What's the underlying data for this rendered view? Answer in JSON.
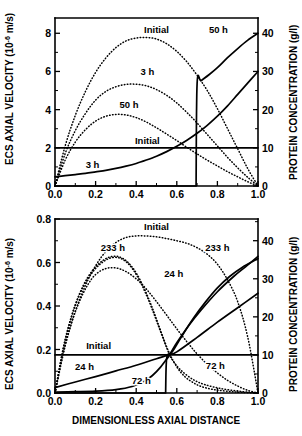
{
  "figure": {
    "xlabel": "DIMENSIONLESS AXIAL DISTANCE",
    "ylabel_left_main": "ECS AXIAL VELOCITY (10",
    "ylabel_left_exp": "-6",
    "ylabel_left_tail": " m/s)",
    "ylabel_right": "PROTEIN CONCENTRATION (g/l)"
  },
  "chart_data": [
    {
      "type": "line",
      "panel": "top",
      "title": "",
      "xlabel": "DIMENSIONLESS AXIAL DISTANCE",
      "ylabel": "ECS AXIAL VELOCITY (10^-6 m/s)",
      "ylabel_right": "PROTEIN CONCENTRATION (g/l)",
      "xlim": [
        0.0,
        1.0
      ],
      "ylim": [
        0,
        8.8
      ],
      "ylim_right": [
        0,
        44
      ],
      "grid": false,
      "legend": "inline-annotations",
      "xticks": [
        "0.0",
        "0.2",
        "0.4",
        "0.6",
        "0.8",
        "1.0"
      ],
      "xtick_values": [
        0.0,
        0.2,
        0.4,
        0.6,
        0.8,
        1.0
      ],
      "yticks_left": [
        "0",
        "2",
        "4",
        "6",
        "8"
      ],
      "ytick_left_values": [
        0,
        2,
        4,
        6,
        8
      ],
      "yticks_right": [
        "0",
        "10",
        "20",
        "30",
        "40"
      ],
      "ytick_right_values": [
        0,
        10,
        20,
        30,
        40
      ],
      "annotations": [
        {
          "text": "Initial",
          "x": 0.5,
          "y": 8.15,
          "series": "velocity-initial"
        },
        {
          "text": "3 h",
          "x": 0.455,
          "y": 5.95,
          "series": "velocity-3h"
        },
        {
          "text": "50 h",
          "x": 0.365,
          "y": 4.25,
          "series": "velocity-50h"
        },
        {
          "text": "Initial",
          "x": 0.455,
          "y": 2.38,
          "series": "concentration-initial"
        },
        {
          "text": "3 h",
          "x": 0.185,
          "y": 1.1,
          "series": "concentration-3h"
        },
        {
          "text": "50 h",
          "x": 0.805,
          "y": 8.15,
          "series": "concentration-50h"
        }
      ],
      "series": [
        {
          "name": "Initial",
          "axis": "left",
          "style": "dotted",
          "label": "Initial",
          "x": [
            0.0,
            0.05,
            0.1,
            0.15,
            0.2,
            0.25,
            0.3,
            0.35,
            0.4,
            0.45,
            0.5,
            0.55,
            0.6,
            0.65,
            0.7,
            0.75,
            0.8,
            0.85,
            0.9,
            0.95,
            1.0
          ],
          "values": [
            0.0,
            2.1,
            3.7,
            4.95,
            5.95,
            6.7,
            7.25,
            7.6,
            7.75,
            7.78,
            7.7,
            7.45,
            7.05,
            6.5,
            5.8,
            5.0,
            4.05,
            3.0,
            1.95,
            0.9,
            0.0
          ]
        },
        {
          "name": "3 h",
          "axis": "left",
          "style": "dotted",
          "label": "3 h",
          "x": [
            0.0,
            0.05,
            0.1,
            0.15,
            0.2,
            0.25,
            0.3,
            0.35,
            0.4,
            0.45,
            0.5,
            0.55,
            0.6,
            0.65,
            0.7,
            0.75,
            0.8,
            0.85,
            0.9,
            0.95,
            1.0
          ],
          "values": [
            0.0,
            1.7,
            2.9,
            3.8,
            4.5,
            4.95,
            5.2,
            5.32,
            5.33,
            5.25,
            5.05,
            4.75,
            4.35,
            3.85,
            3.3,
            2.7,
            2.1,
            1.5,
            0.95,
            0.45,
            0.0
          ]
        },
        {
          "name": "50 h",
          "axis": "left",
          "style": "dotted",
          "label": "50 h",
          "x": [
            0.0,
            0.05,
            0.1,
            0.15,
            0.2,
            0.25,
            0.3,
            0.35,
            0.4,
            0.45,
            0.5,
            0.55,
            0.6,
            0.65,
            0.7,
            0.75,
            0.8,
            0.85,
            0.9,
            0.95,
            1.0
          ],
          "values": [
            0.0,
            1.35,
            2.3,
            2.95,
            3.4,
            3.65,
            3.75,
            3.72,
            3.58,
            3.35,
            3.05,
            2.72,
            2.38,
            2.02,
            1.68,
            1.35,
            1.05,
            0.75,
            0.48,
            0.22,
            0.0
          ]
        },
        {
          "name": "Initial",
          "axis": "right",
          "style": "solid",
          "label": "Initial",
          "x": [
            0.0,
            1.0
          ],
          "values": [
            10.0,
            10.0
          ]
        },
        {
          "name": "3 h",
          "axis": "right",
          "style": "solid",
          "label": "3 h",
          "x": [
            0.0,
            0.05,
            0.1,
            0.15,
            0.2,
            0.25,
            0.3,
            0.35,
            0.4,
            0.45,
            0.5,
            0.55,
            0.6,
            0.65,
            0.7,
            0.75,
            0.8,
            0.85,
            0.9,
            0.95,
            1.0
          ],
          "values": [
            2.4,
            2.7,
            3.0,
            3.3,
            3.7,
            4.1,
            4.6,
            5.2,
            5.9,
            6.8,
            7.8,
            9.0,
            10.4,
            12.0,
            13.8,
            15.9,
            18.3,
            21.0,
            24.0,
            27.0,
            30.0
          ]
        },
        {
          "name": "50 h",
          "axis": "right",
          "style": "solid",
          "label": "50 h",
          "x": [
            0.0,
            0.1,
            0.2,
            0.3,
            0.4,
            0.5,
            0.6,
            0.66,
            0.695,
            0.7,
            0.72,
            0.76,
            0.8,
            0.85,
            0.9,
            0.95,
            1.0
          ],
          "values": [
            0.0,
            0.0,
            0.0,
            0.0,
            0.0,
            0.0,
            0.0,
            0.0,
            0.0,
            26.8,
            27.6,
            29.2,
            31.0,
            33.6,
            36.0,
            38.2,
            40.0
          ]
        }
      ]
    },
    {
      "type": "line",
      "panel": "bottom",
      "title": "",
      "xlabel": "DIMENSIONLESS AXIAL DISTANCE",
      "ylabel": "ECS AXIAL VELOCITY (10^-6 m/s)",
      "ylabel_right": "PROTEIN CONCENTRATION (g/l)",
      "xlim": [
        0.0,
        1.0
      ],
      "ylim": [
        0.0,
        0.8
      ],
      "ylim_right": [
        0,
        45.7
      ],
      "grid": false,
      "legend": "inline-annotations",
      "xticks": [
        "0.0",
        "0.2",
        "0.4",
        "0.6",
        "0.8",
        "1.0"
      ],
      "xtick_values": [
        0.0,
        0.2,
        0.4,
        0.6,
        0.8,
        1.0
      ],
      "yticks_left": [
        "0.0",
        "0.2",
        "0.4",
        "0.6",
        "0.8"
      ],
      "ytick_left_values": [
        0.0,
        0.2,
        0.4,
        0.6,
        0.8
      ],
      "yticks_right": [
        "0",
        "10",
        "20",
        "30",
        "40"
      ],
      "ytick_right_values": [
        0,
        10,
        20,
        30,
        40
      ],
      "annotations": [
        {
          "text": "Initial",
          "x": 0.5,
          "y": 0.765,
          "series": "velocity-initial"
        },
        {
          "text": "233 h",
          "x": 0.285,
          "y": 0.665,
          "series": "velocity-233h"
        },
        {
          "text": "24 h",
          "x": 0.585,
          "y": 0.545,
          "series": "velocity-24h"
        },
        {
          "text": "233 h",
          "x": 0.8,
          "y": 0.665,
          "series": "concentration-233h"
        },
        {
          "text": "Initial",
          "x": 0.215,
          "y": 0.218,
          "series": "concentration-initial"
        },
        {
          "text": "24 h",
          "x": 0.145,
          "y": 0.118,
          "series": "concentration-24h"
        },
        {
          "text": "72 h",
          "x": 0.425,
          "y": 0.055,
          "series": "concentration-72h"
        },
        {
          "text": "72 h",
          "x": 0.79,
          "y": 0.125,
          "series": "velocity-72h"
        }
      ],
      "series": [
        {
          "name": "Initial",
          "axis": "left",
          "style": "dotted",
          "label": "Initial",
          "x": [
            0.0,
            0.05,
            0.1,
            0.15,
            0.2,
            0.25,
            0.3,
            0.35,
            0.4,
            0.45,
            0.5,
            0.55,
            0.6,
            0.65,
            0.7,
            0.75,
            0.8,
            0.85,
            0.9,
            0.95,
            1.0
          ],
          "values": [
            0.0,
            0.215,
            0.375,
            0.495,
            0.585,
            0.65,
            0.692,
            0.715,
            0.722,
            0.722,
            0.718,
            0.71,
            0.7,
            0.688,
            0.668,
            0.638,
            0.592,
            0.52,
            0.42,
            0.255,
            0.0
          ]
        },
        {
          "name": "233 h",
          "axis": "left",
          "style": "dotted",
          "label": "233 h",
          "x": [
            0.0,
            0.04,
            0.08,
            0.12,
            0.16,
            0.2,
            0.24,
            0.28,
            0.32,
            0.36,
            0.4,
            0.44,
            0.48,
            0.52,
            0.56,
            0.6,
            0.64,
            0.68,
            0.72,
            0.78,
            0.85,
            0.92,
            1.0
          ],
          "values": [
            0.0,
            0.205,
            0.35,
            0.455,
            0.53,
            0.58,
            0.612,
            0.628,
            0.625,
            0.6,
            0.552,
            0.48,
            0.39,
            0.288,
            0.19,
            0.12,
            0.075,
            0.048,
            0.03,
            0.016,
            0.008,
            0.003,
            0.0
          ]
        },
        {
          "name": "24 h",
          "axis": "left",
          "style": "dotted",
          "label": "24 h",
          "x": [
            0.0,
            0.04,
            0.08,
            0.12,
            0.16,
            0.2,
            0.25,
            0.3,
            0.35,
            0.4,
            0.45,
            0.5,
            0.55,
            0.6,
            0.65,
            0.7,
            0.75,
            0.8,
            0.85,
            0.9,
            0.95,
            1.0
          ],
          "values": [
            0.0,
            0.185,
            0.32,
            0.42,
            0.495,
            0.545,
            0.572,
            0.575,
            0.558,
            0.525,
            0.478,
            0.42,
            0.358,
            0.295,
            0.235,
            0.18,
            0.132,
            0.092,
            0.058,
            0.032,
            0.012,
            0.0
          ]
        },
        {
          "name": "72 h",
          "axis": "left",
          "style": "dotted",
          "label": "72 h",
          "x": [
            0.0,
            0.04,
            0.08,
            0.12,
            0.16,
            0.2,
            0.24,
            0.28,
            0.32,
            0.36,
            0.4,
            0.44,
            0.48,
            0.52,
            0.56,
            0.58,
            0.62,
            0.68,
            0.74,
            0.82,
            0.9,
            0.96,
            1.0
          ],
          "values": [
            0.0,
            0.2,
            0.345,
            0.45,
            0.522,
            0.572,
            0.605,
            0.622,
            0.62,
            0.595,
            0.545,
            0.472,
            0.382,
            0.282,
            0.185,
            0.15,
            0.105,
            0.062,
            0.038,
            0.02,
            0.009,
            0.003,
            0.0
          ]
        },
        {
          "name": "Initial",
          "axis": "right",
          "style": "solid",
          "label": "Initial",
          "x": [
            0.0,
            1.0
          ],
          "values": [
            10.0,
            10.0
          ]
        },
        {
          "name": "24 h",
          "axis": "right",
          "style": "solid",
          "label": "24 h",
          "x": [
            0.0,
            0.1,
            0.2,
            0.3,
            0.4,
            0.5,
            0.56,
            0.6,
            0.7,
            0.8,
            0.9,
            1.0
          ],
          "values": [
            1.4,
            2.9,
            4.3,
            5.8,
            7.3,
            9.0,
            10.0,
            10.8,
            14.6,
            18.6,
            22.4,
            26.2
          ]
        },
        {
          "name": "72 h",
          "axis": "right",
          "style": "solid",
          "label": "72 h",
          "x": [
            0.0,
            0.1,
            0.2,
            0.3,
            0.38,
            0.44,
            0.48,
            0.52,
            0.56,
            0.58,
            0.62,
            0.68,
            0.74,
            0.8,
            0.86,
            0.92,
            1.0
          ],
          "values": [
            0.25,
            0.35,
            0.5,
            0.9,
            1.7,
            3.1,
            4.6,
            6.8,
            9.6,
            11.0,
            14.5,
            19.5,
            23.8,
            27.6,
            30.6,
            32.9,
            35.3
          ]
        },
        {
          "name": "233 h",
          "axis": "right",
          "style": "solid",
          "label": "233 h",
          "x": [
            0.0,
            0.2,
            0.4,
            0.5,
            0.545,
            0.55,
            0.57,
            0.6,
            0.66,
            0.72,
            0.8,
            0.88,
            0.94,
            1.0
          ],
          "values": [
            0.0,
            0.0,
            0.0,
            0.0,
            0.0,
            9.1,
            10.6,
            13.2,
            17.8,
            21.8,
            26.6,
            30.6,
            33.2,
            35.9
          ]
        }
      ]
    }
  ]
}
